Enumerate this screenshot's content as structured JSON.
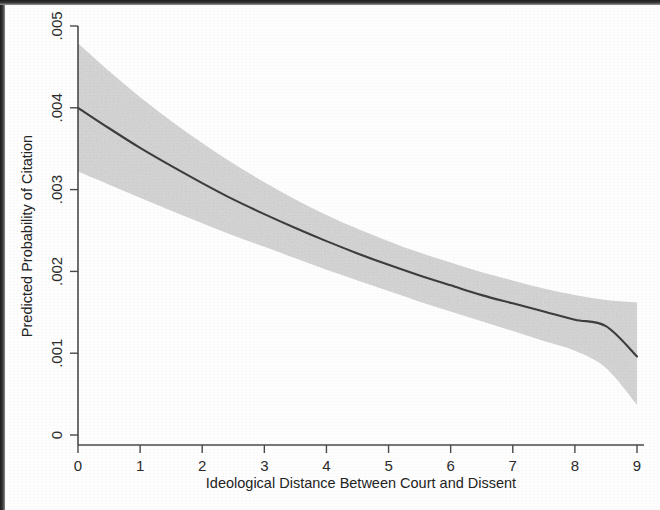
{
  "figure": {
    "background_color": "#fefefe",
    "band_color": "#d6d6d6",
    "line_color": "#3d3d3d",
    "axis_color": "#4a4a4a"
  },
  "chart_data": {
    "type": "line",
    "title": "",
    "subtitle": "",
    "xlabel": "Ideological Distance Between Court and Dissent",
    "ylabel": "Predicted Probability of Citation",
    "xlim": [
      0,
      9
    ],
    "ylim": [
      0,
      0.005
    ],
    "xticks": [
      0,
      1,
      2,
      3,
      4,
      5,
      6,
      7,
      8,
      9
    ],
    "xticklabels": [
      "0",
      "1",
      "2",
      "3",
      "4",
      "5",
      "6",
      "7",
      "8",
      "9"
    ],
    "yticks": [
      0,
      0.001,
      0.002,
      0.003,
      0.004,
      0.005
    ],
    "yticklabels": [
      "0",
      ".001",
      ".002",
      ".003",
      ".004",
      ".005"
    ],
    "grid": false,
    "legend": null,
    "annotations": [],
    "x": [
      0,
      0.5,
      1,
      1.5,
      2,
      2.5,
      3,
      3.5,
      4,
      4.5,
      5,
      5.5,
      6,
      6.5,
      7,
      7.5,
      8,
      8.5,
      9
    ],
    "series": [
      {
        "name": "Predicted probability",
        "style": "solid-line",
        "values": [
          0.004,
          0.00375,
          0.00351,
          0.00329,
          0.00308,
          0.00288,
          0.0027,
          0.00253,
          0.00237,
          0.00222,
          0.00208,
          0.00195,
          0.00183,
          0.00171,
          0.00161,
          0.00151,
          0.00141,
          0.00133,
          0.00096
        ]
      },
      {
        "name": "95% confidence interval upper bound",
        "style": "shaded-band-edge",
        "values": [
          0.00479,
          0.00445,
          0.00413,
          0.00384,
          0.00357,
          0.00332,
          0.00309,
          0.00288,
          0.00269,
          0.00252,
          0.00237,
          0.00223,
          0.00211,
          0.00199,
          0.00189,
          0.00179,
          0.00171,
          0.00165,
          0.00162
        ]
      },
      {
        "name": "95% confidence interval lower bound",
        "style": "shaded-band-edge",
        "values": [
          0.00322,
          0.00306,
          0.0029,
          0.00274,
          0.00259,
          0.00244,
          0.0023,
          0.00216,
          0.00202,
          0.00189,
          0.00176,
          0.00163,
          0.00151,
          0.00139,
          0.00127,
          0.00115,
          0.00103,
          0.00082,
          0.00037
        ]
      }
    ]
  }
}
